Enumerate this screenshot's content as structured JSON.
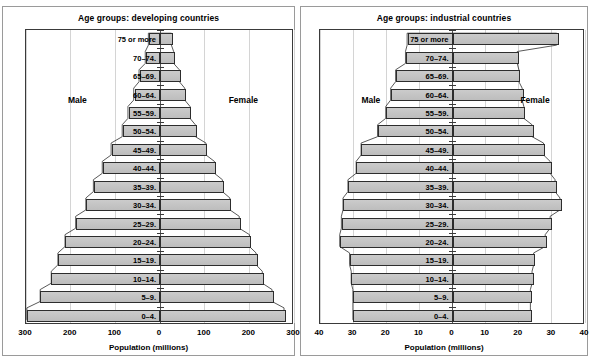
{
  "chart_data": [
    {
      "type": "bar",
      "orientation": "population-pyramid",
      "title": "Age groups: developing countries",
      "xlabel": "Population (millions)",
      "ylabel": "",
      "left_series_label": "Male",
      "right_series_label": "Female",
      "xlim": [
        -300,
        300
      ],
      "xticks": [
        "300",
        "200",
        "100",
        "0",
        "100",
        "200",
        "300"
      ],
      "xtick_values": [
        -300,
        -200,
        -100,
        0,
        100,
        200,
        300
      ],
      "grid": true,
      "legend_position": "inline",
      "categories": [
        "0–4.",
        "5–9.",
        "10–14.",
        "15–19.",
        "20–24.",
        "25–29.",
        "30–34.",
        "35–39.",
        "40–44.",
        "45–49.",
        "50–54.",
        "55–59.",
        "60–64.",
        "65–69.",
        "70–74.",
        "75 or more"
      ],
      "series": [
        {
          "name": "Male",
          "values": [
            298,
            268,
            243,
            228,
            212,
            188,
            165,
            148,
            128,
            108,
            83,
            70,
            57,
            45,
            31,
            24
          ]
        },
        {
          "name": "Female",
          "values": [
            282,
            255,
            233,
            219,
            204,
            181,
            160,
            143,
            125,
            106,
            82,
            70,
            58,
            46,
            33,
            28
          ]
        }
      ]
    },
    {
      "type": "bar",
      "orientation": "population-pyramid",
      "title": "Age groups: industrial countries",
      "xlabel": "Population (millions)",
      "ylabel": "",
      "left_series_label": "Male",
      "right_series_label": "Female",
      "xlim": [
        -40,
        40
      ],
      "xticks": [
        "40",
        "30",
        "20",
        "10",
        "0",
        "10",
        "20",
        "30",
        "40"
      ],
      "xtick_values": [
        -40,
        -30,
        -20,
        -10,
        0,
        10,
        20,
        30,
        40
      ],
      "grid": true,
      "legend_position": "inline",
      "categories": [
        "0–4.",
        "5–9.",
        "10–14.",
        "15–19.",
        "20–24.",
        "25–29.",
        "30–34.",
        "35–39.",
        "40–44.",
        "45–49.",
        "50–54.",
        "55–59.",
        "60–64.",
        "65–69.",
        "70–74.",
        "75 or more"
      ],
      "series": [
        {
          "name": "Male",
          "values": [
            30.0,
            30.0,
            30.5,
            31.0,
            34.0,
            33.5,
            33.0,
            31.5,
            29.0,
            27.5,
            22.5,
            20.0,
            18.5,
            17.0,
            14.0,
            13.5
          ]
        },
        {
          "name": "Female",
          "values": [
            24.0,
            24.0,
            24.5,
            25.0,
            28.5,
            30.0,
            33.0,
            31.5,
            30.0,
            28.0,
            24.5,
            22.0,
            21.5,
            20.5,
            20.0,
            32.0
          ]
        }
      ]
    }
  ],
  "panels": [
    {
      "id": "developing",
      "title": "Age groups: developing countries",
      "male_label": "Male",
      "female_label": "Female",
      "axis_title": "Population (millions)"
    },
    {
      "id": "industrial",
      "title": "Age groups: industrial countries",
      "male_label": "Male",
      "female_label": "Female",
      "axis_title": "Population (millions)"
    }
  ],
  "colors": {
    "bar_fill": "#c2c2c2",
    "bar_stroke": "#2d2d2d",
    "grid": "#d4d4d4",
    "frame": "#3a3a3a",
    "panel_border": "#9a9a9a",
    "text": "#000000",
    "background": "#ffffff"
  }
}
